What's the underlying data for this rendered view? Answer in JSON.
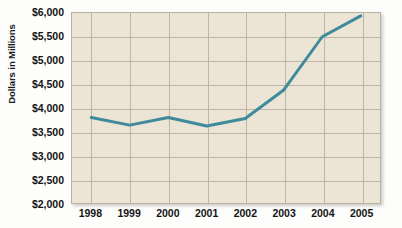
{
  "chart_data": {
    "type": "line",
    "title": "",
    "subtitle": "",
    "xlabel": "",
    "ylabel": "Dollars in Millions",
    "categories": [
      "1998",
      "1999",
      "2000",
      "2001",
      "2002",
      "2003",
      "2004",
      "2005"
    ],
    "series": [
      {
        "name": "Dollars in Millions",
        "values": [
          3800,
          3640,
          3800,
          3620,
          3780,
          4380,
          5500,
          5940
        ],
        "color": "#3f8a9c"
      }
    ],
    "ylim": [
      2000,
      6000
    ],
    "ytick_values": [
      2000,
      2500,
      3000,
      3500,
      4000,
      4500,
      5000,
      5500,
      6000
    ],
    "ytick_labels": [
      "$2,000",
      "$2,500",
      "$3,000",
      "$3,500",
      "$4,000",
      "$4,500",
      "$5,000",
      "$5,500",
      "$6,000"
    ],
    "grid": true,
    "legend": "none",
    "plot_background": "#ece4d4",
    "grid_color": "#b6ada0",
    "figure_background": "#fdfdfc",
    "annotations": []
  }
}
